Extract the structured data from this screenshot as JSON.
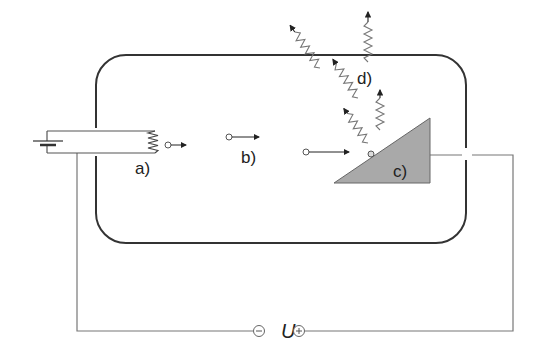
{
  "labels": {
    "a": "a)",
    "b": "b)",
    "c": "c)",
    "d": "d)",
    "voltage": "U"
  },
  "terminals": {
    "negative": "−",
    "positive": "+"
  },
  "components": {
    "cathode": "heated filament (a)",
    "electron_beam": "accelerated electrons (b)",
    "anode": "anode target (c)",
    "xrays": "emitted X-ray photons (d)"
  },
  "colors": {
    "line": "#333333",
    "anode_fill": "#a9a9a9",
    "wire": "#666666"
  }
}
